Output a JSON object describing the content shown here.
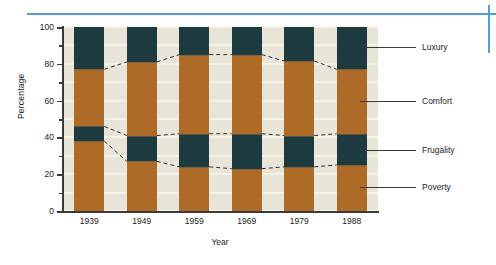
{
  "chart_data": {
    "type": "bar",
    "subtype": "stacked-100-percent",
    "title": "",
    "xlabel": "Year",
    "ylabel": "Percentage",
    "categories": [
      "1939",
      "1949",
      "1959",
      "1969",
      "1979",
      "1988"
    ],
    "ylim": [
      0,
      100
    ],
    "yticks": [
      0,
      20,
      40,
      60,
      80,
      100
    ],
    "ytick_labels": [
      "0",
      "20",
      "40",
      "60",
      "80",
      "100"
    ],
    "minor_tick_step": 10,
    "grid": true,
    "grid_orientation": "horizontal",
    "legend_position": "right",
    "stack_order_bottom_to_top": [
      "Poverty",
      "Frugality",
      "Comfort",
      "Luxury"
    ],
    "series": [
      {
        "name": "Poverty",
        "color": "#ae6b27",
        "values": [
          38,
          27,
          24,
          23,
          24,
          25
        ]
      },
      {
        "name": "Frugality",
        "color": "#1d3b3e",
        "values": [
          8,
          14,
          18,
          19,
          17,
          17
        ]
      },
      {
        "name": "Comfort",
        "color": "#ae6b27",
        "values": [
          31,
          40,
          43,
          43,
          40.5,
          35
        ]
      },
      {
        "name": "Luxury",
        "color": "#1d3b3e",
        "values": [
          23,
          19,
          15,
          15,
          18.5,
          23
        ]
      }
    ],
    "cumulative_boundaries": {
      "poverty_top": [
        38,
        27,
        24,
        23,
        24,
        25
      ],
      "frugality_top": [
        46,
        41,
        42,
        42,
        41,
        42
      ],
      "comfort_top": [
        77,
        81,
        85,
        85,
        81.5,
        77
      ],
      "luxury_top": [
        100,
        100,
        100,
        100,
        100,
        100
      ]
    }
  },
  "legend": {
    "items": [
      {
        "label": "Luxury",
        "value_axis": 89
      },
      {
        "label": "Comfort",
        "value_axis": 60
      },
      {
        "label": "Frugality",
        "value_axis": 33
      },
      {
        "label": "Poverty",
        "value_axis": 13
      }
    ]
  },
  "colors": {
    "dark": "#1d3b3e",
    "light": "#ae6b27",
    "plot_background": "#e8e4d8",
    "gridline": "#f4f1e8",
    "accent_rule": "#5b9bd5",
    "axis": "#3a3a3a"
  }
}
